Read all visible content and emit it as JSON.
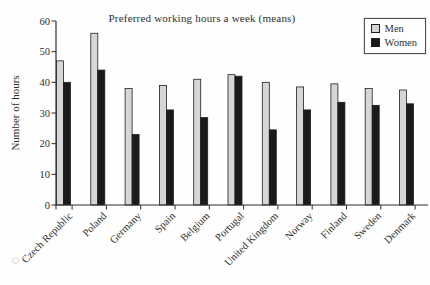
{
  "chart_data": {
    "type": "bar",
    "title": "Preferred working hours a week (means)",
    "ylabel": "Number of hours",
    "xlabel": "",
    "ylim": [
      0,
      60
    ],
    "yticks": [
      0,
      10,
      20,
      30,
      40,
      50,
      60
    ],
    "grid": false,
    "legend_position": "top-right",
    "categories": [
      "Czech Republic",
      "Poland",
      "Germany",
      "Spain",
      "Belgium",
      "Portugal",
      "United Kingdom",
      "Norway",
      "Finland",
      "Sweden",
      "Denmark"
    ],
    "series": [
      {
        "name": "Men",
        "color": "#d6d6d6",
        "values": [
          47,
          56,
          38,
          39,
          41,
          42.5,
          40,
          38.5,
          39.5,
          38,
          37.5
        ]
      },
      {
        "name": "Women",
        "color": "#1a1a1a",
        "values": [
          40,
          44,
          23,
          31,
          28.5,
          42,
          24.5,
          31,
          33.5,
          32.5,
          33
        ]
      }
    ],
    "colors": {
      "bar_outline": "#1f1f1f",
      "axis": "#2e2e2e",
      "text": "#2f2f2f",
      "background": "#fefefe"
    }
  }
}
